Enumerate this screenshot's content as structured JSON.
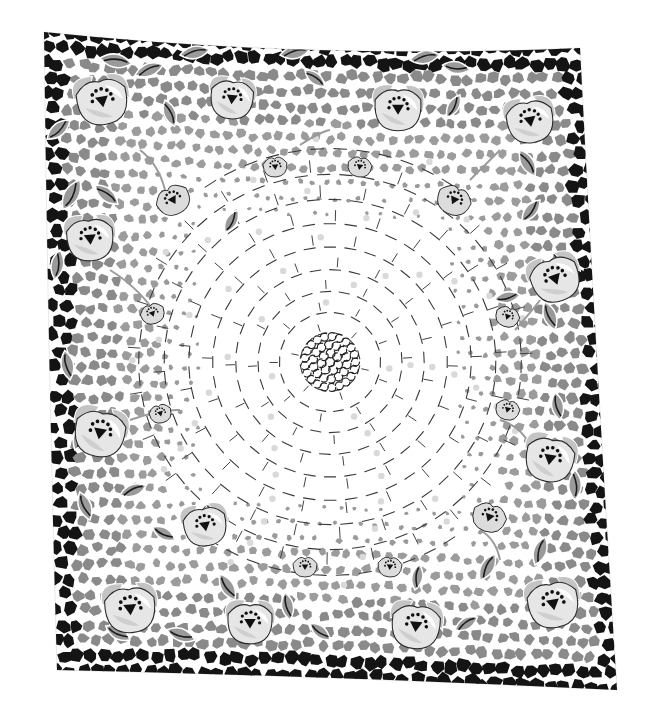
{
  "image": {
    "subject": "vintage printed handkerchief",
    "description": "Square printed cloth with black mosaic border, gray mosaic band with white flowers and gray leaves, and a white center with dashed hexagonal web radiating from a central rosette",
    "palette": {
      "background": "#ffffff",
      "border_tiles": "#141414",
      "mid_tiles": "#8a8a8a",
      "light_tiles": "#b9b9b9",
      "petal": "#e6e6e6",
      "petal_shade": "#c4c4c4",
      "leaf": "#9a9a9a",
      "outline": "#2a2a2a",
      "dots": "#d9d9d9"
    },
    "motifs": {
      "large_flowers": [
        {
          "name": "top-left-corner-flower"
        },
        {
          "name": "top-left-flower-2"
        },
        {
          "name": "top-center-flower"
        },
        {
          "name": "top-right-flower"
        },
        {
          "name": "top-right-corner-flower"
        },
        {
          "name": "left-upper-flower"
        },
        {
          "name": "left-lower-flower"
        },
        {
          "name": "right-upper-flower"
        },
        {
          "name": "right-lower-flower"
        },
        {
          "name": "bottom-left-corner-flower"
        },
        {
          "name": "bottom-left-flower-2"
        },
        {
          "name": "bottom-center-flower"
        },
        {
          "name": "bottom-right-flower"
        },
        {
          "name": "bottom-right-corner-flower"
        }
      ],
      "buds": [
        {
          "name": "bud-top-1"
        },
        {
          "name": "bud-top-2"
        },
        {
          "name": "bud-top-3"
        },
        {
          "name": "bud-left-1"
        },
        {
          "name": "bud-left-2"
        },
        {
          "name": "bud-left-3"
        },
        {
          "name": "bud-right-1"
        },
        {
          "name": "bud-right-2"
        },
        {
          "name": "bud-right-3"
        },
        {
          "name": "bud-bottom-1"
        },
        {
          "name": "bud-bottom-2"
        },
        {
          "name": "bud-bottom-3"
        }
      ]
    }
  }
}
